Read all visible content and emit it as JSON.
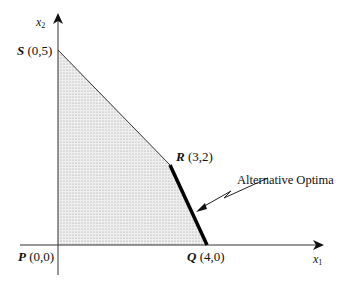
{
  "diagram": {
    "type": "linear-programming-feasible-region",
    "axes": {
      "x_label": "x",
      "x_subscript": "1",
      "y_label": "x",
      "y_subscript": "2"
    },
    "points": [
      {
        "id": "P",
        "name": "P",
        "coords": "(0,0)"
      },
      {
        "id": "Q",
        "name": "Q",
        "coords": "(4,0)"
      },
      {
        "id": "R",
        "name": "R",
        "coords": "(3,2)"
      },
      {
        "id": "S",
        "name": "S",
        "coords": "(0,5)"
      }
    ],
    "feasible_region": [
      "P",
      "Q",
      "R",
      "S"
    ],
    "highlighted_edge": [
      "R",
      "Q"
    ],
    "annotation": "Alternative Optima",
    "colors": {
      "region_fill": "#e6e6e6",
      "lines": "#111111",
      "highlight_edge": "#000000"
    }
  }
}
